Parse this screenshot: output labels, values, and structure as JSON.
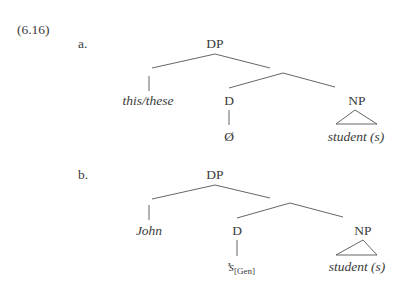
{
  "example_number": "(6.16)",
  "trees": [
    {
      "label": "a.",
      "root": "DP",
      "specifier": "this/these",
      "head": "D",
      "head_content": "Ø",
      "complement": "NP",
      "complement_content": "student (s)"
    },
    {
      "label": "b.",
      "root": "DP",
      "specifier": "John",
      "head": "D",
      "head_content": "’s",
      "head_feature": "[Gen]",
      "complement": "NP",
      "complement_content": "student (s)"
    }
  ]
}
